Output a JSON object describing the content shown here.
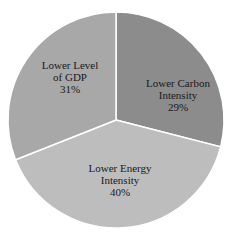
{
  "chart_data": {
    "type": "pie",
    "title": "",
    "categories": [
      "Lower Carbon Intensity",
      "Lower Energy Intensity",
      "Lower Level of GDP"
    ],
    "values": [
      29,
      40,
      31
    ],
    "unit": "%",
    "colors": [
      "#8c8c8c",
      "#bdbdbd",
      "#a8a8a8"
    ],
    "start_angle_deg": 0,
    "direction": "clockwise",
    "legend": "none (inline labels)"
  },
  "labels": [
    {
      "line1": "Lower Carbon",
      "line2": "Intensity",
      "pct": "29%"
    },
    {
      "line1": "Lower Energy",
      "line2": "Intensity",
      "pct": "40%"
    },
    {
      "line1": "Lower Level",
      "line2": "of GDP",
      "pct": "31%"
    }
  ]
}
